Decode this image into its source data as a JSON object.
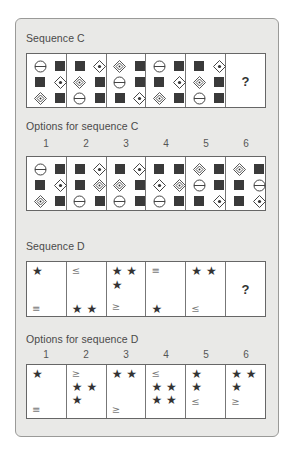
{
  "sequence_c": {
    "title": "Sequence C",
    "cells": [
      [
        "circle-bar",
        "square",
        "square",
        "diamond-dot",
        "diamond-nested",
        "square"
      ],
      [
        "square",
        "diamond-dot",
        "diamond-nested",
        "square",
        "circle-bar",
        "square"
      ],
      [
        "diamond-nested",
        "square",
        "circle-bar",
        "square",
        "square",
        "diamond-dot"
      ],
      [
        "circle-bar",
        "square",
        "square",
        "diamond-dot",
        "diamond-nested",
        "square"
      ],
      [
        "square",
        "diamond-dot",
        "diamond-nested",
        "square",
        "circle-bar",
        "square"
      ]
    ],
    "unknown_label": "?"
  },
  "options_c": {
    "title": "Options for sequence C",
    "numbers": [
      "1",
      "2",
      "3",
      "4",
      "5",
      "6"
    ],
    "cells": [
      [
        "circle-bar",
        "square",
        "square",
        "diamond-dot",
        "diamond-nested",
        "square"
      ],
      [
        "square",
        "diamond-dot",
        "square",
        "diamond-nested",
        "circle-bar",
        "square"
      ],
      [
        "square",
        "diamond-dot",
        "diamond-nested",
        "square",
        "circle-bar",
        "square"
      ],
      [
        "square",
        "square",
        "diamond-dot",
        "diamond-nested",
        "circle-bar",
        "square"
      ],
      [
        "diamond-nested",
        "square",
        "circle-bar",
        "square",
        "square",
        "diamond-dot"
      ],
      [
        "diamond-nested",
        "square",
        "square",
        "circle-bar",
        "square",
        "diamond-dot"
      ]
    ]
  },
  "sequence_d": {
    "title": "Sequence D",
    "cells": [
      [
        {
          "text": "★",
          "top": 0
        },
        {
          "text": "≡",
          "top": 38,
          "op": true
        }
      ],
      [
        {
          "text": "≤",
          "top": 0,
          "op": true
        },
        {
          "text": "★ ★",
          "top": 38
        }
      ],
      [
        {
          "text": "★ ★",
          "top": 0
        },
        {
          "text": "★",
          "top": 14
        },
        {
          "text": "≥",
          "top": 36,
          "op": true
        }
      ],
      [
        {
          "text": "≡",
          "top": 0,
          "op": true
        },
        {
          "text": "★",
          "top": 38
        }
      ],
      [
        {
          "text": "★ ★",
          "top": 0
        },
        {
          "text": "≤",
          "top": 38,
          "op": true
        }
      ]
    ],
    "unknown_label": "?"
  },
  "options_d": {
    "title": "Options for sequence D",
    "numbers": [
      "1",
      "2",
      "3",
      "4",
      "5",
      "6"
    ],
    "cells": [
      [
        {
          "text": "★",
          "top": 0
        },
        {
          "text": "≡",
          "top": 36,
          "op": true
        }
      ],
      [
        {
          "text": "≥",
          "top": 0,
          "op": true
        },
        {
          "text": "★ ★",
          "top": 13
        },
        {
          "text": "★",
          "top": 26
        }
      ],
      [
        {
          "text": "★ ★",
          "top": 0
        },
        {
          "text": "≥",
          "top": 36,
          "op": true
        }
      ],
      [
        {
          "text": "≤",
          "top": 0,
          "op": true
        },
        {
          "text": "★ ★",
          "top": 13
        },
        {
          "text": "★ ★",
          "top": 26
        }
      ],
      [
        {
          "text": "★",
          "top": 0
        },
        {
          "text": "★",
          "top": 13
        },
        {
          "text": "≤",
          "top": 28,
          "op": true
        }
      ],
      [
        {
          "text": "★ ★",
          "top": 0
        },
        {
          "text": "★",
          "top": 13
        },
        {
          "text": "≥",
          "top": 28,
          "op": true
        }
      ]
    ]
  }
}
